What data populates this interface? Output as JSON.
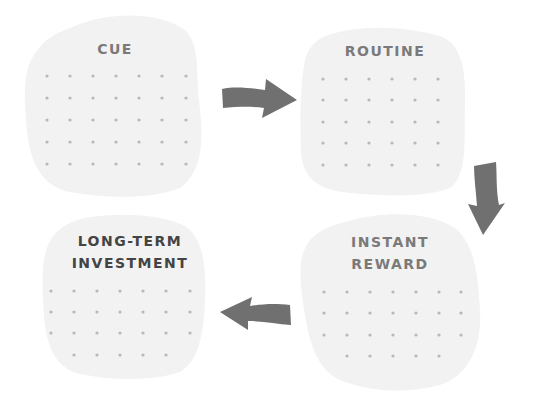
{
  "diagram": {
    "type": "habit-loop cycle",
    "nodes": [
      {
        "id": "cue",
        "label": "CUE",
        "position": "top-left"
      },
      {
        "id": "routine",
        "label": "ROUTINE",
        "position": "top-right"
      },
      {
        "id": "instant_reward",
        "label": "INSTANT\nREWARD",
        "position": "bottom-right"
      },
      {
        "id": "long_term_investment",
        "label": "LONG-TERM\nINVESTMENT",
        "position": "bottom-left",
        "emphasized": true
      }
    ],
    "edges": [
      {
        "from": "cue",
        "to": "routine",
        "direction": "right"
      },
      {
        "from": "routine",
        "to": "instant_reward",
        "direction": "down"
      },
      {
        "from": "instant_reward",
        "to": "long_term_investment",
        "direction": "left"
      }
    ]
  },
  "colors": {
    "blob_fill": "#f2f2f2",
    "dot": "#b8b8b8",
    "arrow": "#707070",
    "label_light": "#7a7a7a",
    "label_dark": "#444444",
    "background": "#ffffff"
  },
  "icons": {
    "arrow_right": "arrow-right-icon",
    "arrow_down": "arrow-down-icon",
    "arrow_left": "arrow-left-icon"
  }
}
